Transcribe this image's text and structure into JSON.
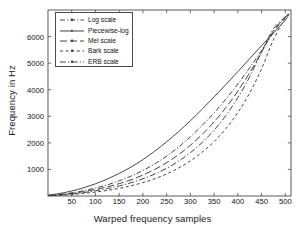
{
  "chart_data": {
    "type": "line",
    "title": "",
    "xlabel": "Warped frequency samples",
    "ylabel": "Frequency in Hz",
    "xlim": [
      0,
      512
    ],
    "ylim": [
      0,
      7000
    ],
    "xticks": [
      50,
      100,
      150,
      200,
      250,
      300,
      350,
      400,
      450,
      500
    ],
    "yticks": [
      1000,
      2000,
      3000,
      4000,
      5000,
      6000
    ],
    "grid": false,
    "legend_position": "upper-left",
    "series": [
      {
        "name": "Log scale",
        "style": "dash-dot",
        "color": "#3c3c3c",
        "x": [
          0,
          25,
          50,
          75,
          100,
          125,
          150,
          175,
          200,
          225,
          250,
          275,
          300,
          325,
          350,
          375,
          400,
          425,
          450,
          475,
          500,
          508
        ],
        "values": [
          20,
          60,
          120,
          200,
          300,
          420,
          570,
          750,
          960,
          1210,
          1500,
          1840,
          2230,
          2660,
          3130,
          3650,
          4220,
          4830,
          5480,
          6150,
          6760,
          6850
        ]
      },
      {
        "name": "Piecewise-log",
        "style": "solid",
        "color": "#3c3c3c",
        "x": [
          0,
          25,
          50,
          75,
          100,
          125,
          150,
          175,
          200,
          225,
          250,
          275,
          300,
          325,
          350,
          375,
          400,
          425,
          450,
          475,
          500,
          508
        ],
        "values": [
          30,
          95,
          190,
          310,
          460,
          640,
          850,
          1090,
          1370,
          1690,
          2040,
          2420,
          2830,
          3270,
          3730,
          4200,
          4680,
          5170,
          5660,
          6130,
          6620,
          6850
        ]
      },
      {
        "name": "Mel scale",
        "style": "long-dash",
        "color": "#3c3c3c",
        "x": [
          0,
          25,
          50,
          75,
          100,
          125,
          150,
          175,
          200,
          225,
          250,
          275,
          300,
          325,
          350,
          375,
          400,
          425,
          450,
          475,
          500,
          508
        ],
        "values": [
          15,
          50,
          100,
          165,
          245,
          345,
          465,
          610,
          790,
          1000,
          1255,
          1555,
          1910,
          2320,
          2790,
          3330,
          3950,
          4640,
          5410,
          6220,
          6730,
          6850
        ]
      },
      {
        "name": "Bark scale",
        "style": "short-dash",
        "color": "#3c3c3c",
        "x": [
          0,
          25,
          50,
          75,
          100,
          125,
          150,
          175,
          200,
          225,
          250,
          275,
          300,
          325,
          350,
          375,
          400,
          425,
          450,
          475,
          500,
          508
        ],
        "values": [
          8,
          28,
          58,
          98,
          148,
          210,
          288,
          385,
          505,
          650,
          830,
          1050,
          1320,
          1650,
          2050,
          2540,
          3140,
          3880,
          4790,
          5880,
          6700,
          6850
        ]
      },
      {
        "name": "ERB scale",
        "style": "dash-dot-long",
        "color": "#3c3c3c",
        "x": [
          0,
          25,
          50,
          75,
          100,
          125,
          150,
          175,
          200,
          225,
          250,
          275,
          300,
          325,
          350,
          375,
          400,
          425,
          450,
          475,
          500,
          508
        ],
        "values": [
          12,
          38,
          78,
          130,
          196,
          278,
          378,
          500,
          648,
          828,
          1046,
          1310,
          1630,
          2015,
          2480,
          3035,
          3700,
          4490,
          5420,
          6290,
          6740,
          6850
        ]
      }
    ]
  }
}
